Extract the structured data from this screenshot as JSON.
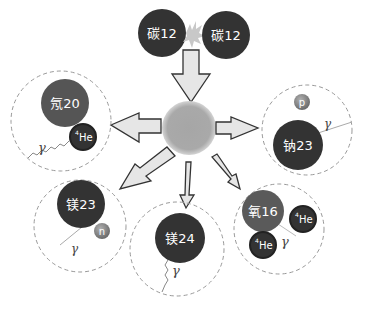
{
  "diagram": {
    "reactants": [
      {
        "id": "c12_left",
        "label": "碳12"
      },
      {
        "id": "c12_right",
        "label": "碳12"
      }
    ],
    "center": {
      "label": "compound nucleus"
    },
    "products": [
      {
        "id": "ne20",
        "nucleus": "氖20",
        "particles": [
          "4He"
        ],
        "photon": "γ"
      },
      {
        "id": "na23",
        "nucleus": "钠23",
        "particles": [
          "p"
        ],
        "photon": "γ"
      },
      {
        "id": "mg23",
        "nucleus": "镁23",
        "particles": [
          "n"
        ],
        "photon": "γ"
      },
      {
        "id": "mg24",
        "nucleus": "镁24",
        "particles": [],
        "photon": "γ"
      },
      {
        "id": "o16",
        "nucleus": "氧16",
        "particles": [
          "4He",
          "4He"
        ],
        "photon": "γ"
      }
    ],
    "labels": {
      "he_sup": "4",
      "he": "He",
      "proton": "p",
      "neutron": "n",
      "gamma": "γ"
    },
    "colors": {
      "nucleus_dark": "#333333",
      "nucleus_gray": "#5a5a5a",
      "center_sphere": "#a9a9a9",
      "arrow_fill": "#e6e6e6",
      "arrow_stroke": "#333333",
      "dashed_circle": "#999999",
      "spark": "#bfbfbf"
    }
  }
}
